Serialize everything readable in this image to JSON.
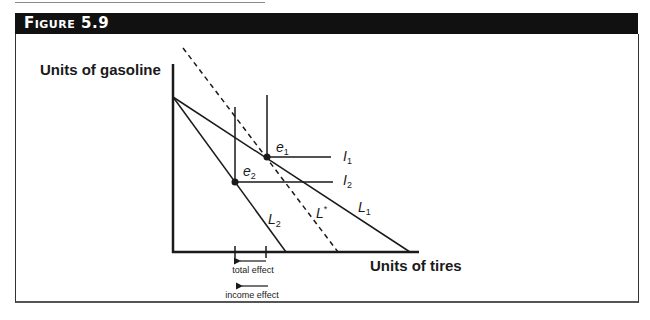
{
  "figure": {
    "title": "Figure 5.9"
  },
  "axes": {
    "y_label": "Units of gasoline",
    "x_label": "Units of tires"
  },
  "curves": {
    "L1": {
      "name": "L",
      "sub": "1"
    },
    "L2": {
      "name": "L",
      "sub": "2"
    },
    "Lstar": {
      "name": "L",
      "sup": "*"
    },
    "I1": {
      "name": "I",
      "sub": "1"
    },
    "I2": {
      "name": "I",
      "sub": "2"
    }
  },
  "points": {
    "e1": {
      "name": "e",
      "sub": "1"
    },
    "e2": {
      "name": "e",
      "sub": "2"
    }
  },
  "annotations": {
    "total_effect": "total effect",
    "income_effect": "income effect"
  },
  "colors": {
    "header_bg": "#111111",
    "header_text": "#ffffff",
    "line": "#1a1a1a"
  }
}
